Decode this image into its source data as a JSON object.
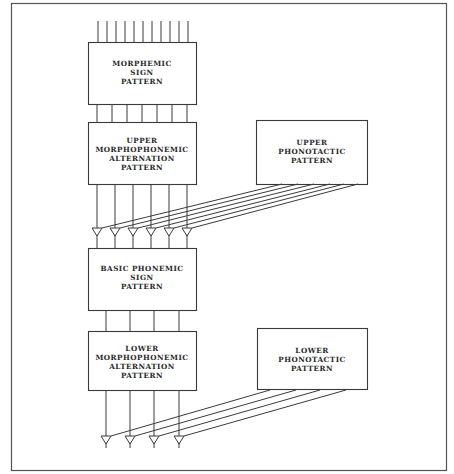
{
  "diagram": {
    "type": "stratificational-linguistics-block-diagram",
    "boxes": {
      "morphemic_sign": {
        "lines": [
          "MORPHEMIC",
          "SIGN",
          "PATTERN"
        ]
      },
      "upper_morphophonemic": {
        "lines": [
          "UPPER",
          "MORPHOPHONEMIC",
          "ALTERNATION",
          "PATTERN"
        ]
      },
      "upper_phonotactic": {
        "lines": [
          "UPPER",
          "PHONOTACTIC",
          "PATTERN"
        ]
      },
      "basic_phonemic_sign": {
        "lines": [
          "BASIC PHONEMIC",
          "SIGN",
          "PATTERN"
        ]
      },
      "lower_morphophonemic": {
        "lines": [
          "LOWER",
          "MORPHOPHONEMIC",
          "ALTERNATION",
          "PATTERN"
        ]
      },
      "lower_phonotactic": {
        "lines": [
          "LOWER",
          "PHONOTACTIC",
          "PATTERN"
        ]
      }
    },
    "connections": {
      "top_inputs_count": 11,
      "morphemic_to_upper_morphophonemic": 7,
      "upper_morphophonemic_outputs": 6,
      "basic_to_lower_morphophonemic": 4,
      "lower_morphophonemic_outputs": 4
    },
    "colors": {
      "line": "#3a3a3a",
      "background": "#ffffff"
    }
  }
}
